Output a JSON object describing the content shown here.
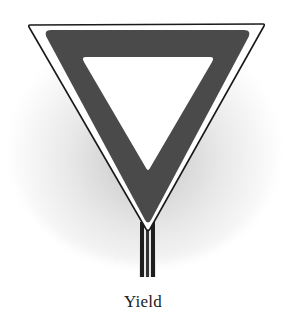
{
  "figure": {
    "caption": "Yield",
    "colors": {
      "border_band": "#4a4a4a",
      "outline": "#1a1a1a",
      "inner_field": "#ffffff",
      "post_dark": "#1e1e1e",
      "post_light": "#e8e8e8",
      "shadow": "#9a9a9a"
    }
  }
}
